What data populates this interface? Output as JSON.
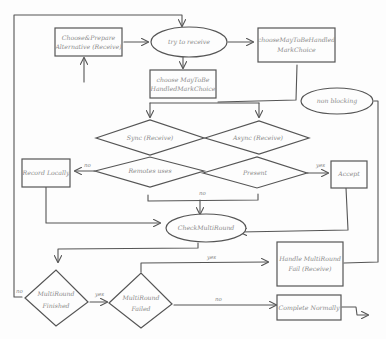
{
  "diagram": {
    "type": "flowchart",
    "style": "hand-drawn sketch",
    "nodes": {
      "choose_prepare": {
        "shape": "rect",
        "line1": "Choose&Prepare",
        "line2": "Alternative (Receive)"
      },
      "try_to_receive": {
        "shape": "ellipse",
        "line1": "try to receive"
      },
      "choose_may_unhandled": {
        "shape": "rect",
        "line1": "chooseMayToBeHandled",
        "line2": "MarkChoice"
      },
      "choose_may_to_be": {
        "shape": "rect",
        "line1": "choose MayToBe",
        "line2": "HandledMarkChoice"
      },
      "sync_receive": {
        "shape": "diamond",
        "line1": "Sync (Receive)"
      },
      "async_receive": {
        "shape": "diamond",
        "line1": "Async (Receive)"
      },
      "remote_uses": {
        "shape": "diamond",
        "line1": "Remotes uses"
      },
      "present": {
        "shape": "diamond",
        "line1": "Present"
      },
      "record_locally": {
        "shape": "rect",
        "line1": "Record Locally"
      },
      "accept": {
        "shape": "rect",
        "line1": "Accept"
      },
      "non_blocking": {
        "shape": "ellipse",
        "line1": "non blocking"
      },
      "check_multiround": {
        "shape": "ellipse",
        "line1": "CheckMultiRound"
      },
      "multiround_finished": {
        "shape": "diamond",
        "line1": "MultiRound",
        "line2": "Finished"
      },
      "multiround_failed": {
        "shape": "diamond",
        "line1": "MultiRound",
        "line2": "Failed"
      },
      "handle_multiround_fail": {
        "shape": "rect",
        "line1": "Handle MultiRound",
        "line2": "Fail (Receive)"
      },
      "complete_normally": {
        "shape": "rect",
        "line1": "Complete Normally"
      }
    },
    "edge_labels": {
      "remote_no": "no",
      "present_yes": "yes",
      "merge_no": "no",
      "finished_no": "no",
      "finished_yes": "yes",
      "failed_yes": "yes",
      "failed_no": "no"
    }
  }
}
